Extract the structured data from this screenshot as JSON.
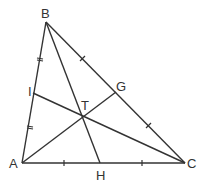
{
  "diagram": {
    "type": "triangle-cevians",
    "points": {
      "A": {
        "label": "A",
        "x": 22,
        "y": 163
      },
      "B": {
        "label": "B",
        "x": 46,
        "y": 22
      },
      "C": {
        "label": "C",
        "x": 185,
        "y": 163
      },
      "G": {
        "label": "G",
        "x": 116,
        "y": 92
      },
      "I": {
        "label": "I",
        "x": 33,
        "y": 93
      },
      "H": {
        "label": "H",
        "x": 100,
        "y": 163
      },
      "T": {
        "label": "T",
        "x": 84,
        "y": 118
      }
    },
    "segments": [
      "AB",
      "BC",
      "CA",
      "BH",
      "AG",
      "CI"
    ],
    "tick_marks": {
      "AB": "equal segments AI = IB (double tick)",
      "BC": "equal segments BG = GC (single tick)",
      "AC": "equal segments AH = HC (single tick)"
    },
    "stroke_color": "#333333"
  }
}
